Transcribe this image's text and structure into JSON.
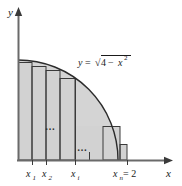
{
  "figure": {
    "colors": {
      "fill": "#d2d2d2",
      "stroke": "#3a3a3a",
      "axis": "#4a4a4a",
      "text": "#1a1a1a",
      "background": "#ffffff"
    },
    "axes": {
      "y_label": "y",
      "x_label": "x",
      "origin": {
        "x": 18,
        "y": 160
      },
      "x_axis_end": 172,
      "y_axis_top": 8
    },
    "curve": {
      "equation_parts": {
        "lhs": "y",
        "equals": "=",
        "radical": "√",
        "radicand_a": "4",
        "minus": "−",
        "radicand_b": "x",
        "exponent": "2"
      },
      "equation_plain": "y = √(4 − x²)",
      "radius": 2
    },
    "tick_labels": [
      {
        "base": "x",
        "sub": "1",
        "suffix": "",
        "x": 32
      },
      {
        "base": "x",
        "sub": "2",
        "suffix": "",
        "x": 46
      },
      {
        "base": "x",
        "sub": "i",
        "suffix": "",
        "x": 75
      },
      {
        "base": "x",
        "sub": "n",
        "suffix": " = 2",
        "x": 120
      }
    ],
    "ellipses": [
      {
        "text": "…",
        "x": 52,
        "y": 128
      },
      {
        "text": "…",
        "x": 84,
        "y": 149
      }
    ],
    "rectangles": [
      {
        "left": 18,
        "right": 32,
        "top": 62
      },
      {
        "left": 32,
        "right": 46,
        "top": 66
      },
      {
        "left": 46,
        "right": 60,
        "top": 70
      },
      {
        "left": 60,
        "right": 75,
        "top": 78
      },
      {
        "left": 103,
        "right": 120,
        "top": 126
      },
      {
        "left": 120,
        "right": 127,
        "top": 144
      }
    ],
    "shaded_region": {
      "baseline_y": 160,
      "left_x": 18,
      "right_x": 127
    }
  }
}
